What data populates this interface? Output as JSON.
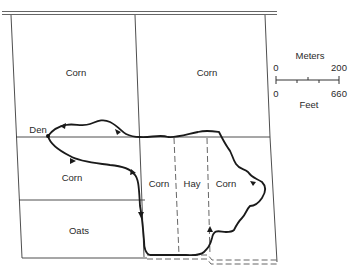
{
  "diagram": {
    "type": "field map with animal movement path",
    "fields": [
      {
        "id": "nw",
        "label": "Corn"
      },
      {
        "id": "ne",
        "label": "Corn"
      },
      {
        "id": "w-mid",
        "label": "Corn"
      },
      {
        "id": "sw",
        "label": "Oats"
      },
      {
        "id": "s-corn-left",
        "label": "Corn"
      },
      {
        "id": "s-hay",
        "label": "Hay"
      },
      {
        "id": "s-corn-right",
        "label": "Corn"
      }
    ],
    "den_label": "Den",
    "scale": {
      "top_unit": "Meters",
      "top_min": "0",
      "top_max": "200",
      "bottom_min": "0",
      "bottom_max": "660",
      "bottom_unit": "Feet"
    },
    "colors": {
      "line": "#2b2b2b",
      "path": "#1a1a1a",
      "background": "#ffffff"
    }
  }
}
